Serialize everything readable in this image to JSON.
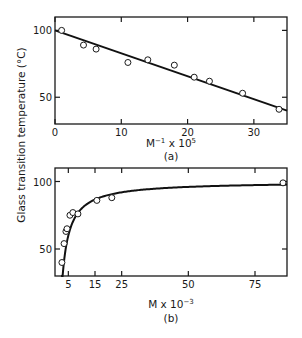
{
  "shared": {
    "ylabel": "Glass transition temperature (°C)"
  },
  "chart_data": [
    {
      "type": "scatter",
      "panel_label": "(a)",
      "xlabel": "M",
      "xlabel_sup": "−1",
      "xlabel_suffix": " x 10",
      "xlabel_suffix_sup": "5",
      "ylabel": "Glass transition temperature (°C)",
      "xlim": [
        0,
        35
      ],
      "ylim": [
        30,
        110
      ],
      "xticks": [
        0,
        10,
        20,
        30
      ],
      "xtick_labels": [
        "0",
        "10",
        "20",
        "30"
      ],
      "yticks": [
        50,
        100
      ],
      "ytick_labels": [
        "50",
        "100"
      ],
      "grid": false,
      "series": [
        {
          "name": "measured",
          "marker": "open-circle",
          "x": [
            1,
            4.3,
            6.2,
            11,
            14,
            18,
            21,
            23.3,
            28.3,
            33.8
          ],
          "y": [
            100,
            89,
            86,
            76,
            78,
            74,
            65,
            62,
            53,
            41
          ]
        },
        {
          "name": "linear fit",
          "style": "line",
          "x": [
            0,
            35
          ],
          "y": [
            100,
            40
          ]
        }
      ]
    },
    {
      "type": "scatter",
      "panel_label": "(b)",
      "xlabel": "M x 10",
      "xlabel_sup": "−3",
      "ylabel": "Glass transition temperature (°C)",
      "xlim": [
        0,
        87
      ],
      "ylim": [
        30,
        110
      ],
      "xticks": [
        5,
        15,
        25,
        50,
        75
      ],
      "xtick_labels": [
        "5",
        "15",
        "25",
        "50",
        "75"
      ],
      "yticks": [
        50,
        100
      ],
      "ytick_labels": [
        "50",
        "100"
      ],
      "grid": false,
      "series": [
        {
          "name": "measured",
          "marker": "open-circle",
          "x": [
            2.6,
            3.4,
            4.1,
            4.5,
            5.6,
            6.7,
            8.6,
            15.7,
            21.3,
            85.5
          ],
          "y": [
            40,
            54,
            63,
            65,
            75,
            77,
            76,
            86,
            88,
            99
          ]
        },
        {
          "name": "fit curve",
          "style": "curve",
          "model": "Tg = Tinf - K/M",
          "Tinf": 100,
          "K": 200,
          "x_start": 2.3
        }
      ]
    }
  ]
}
